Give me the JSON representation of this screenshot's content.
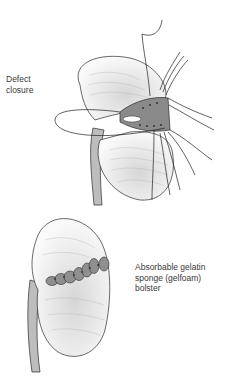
{
  "figure": {
    "panels": [
      {
        "id": "top",
        "label": "Defect\nclosure",
        "description": "Kidney with parenchymal defect being closed with interrupted sutures"
      },
      {
        "id": "bottom",
        "label": "Absorbable gelatin\nsponge (gelfoam)\nbolster",
        "description": "Kidney with sutures tied over a gelfoam bolster"
      }
    ],
    "colors": {
      "line": "#2a2a2a",
      "shade": "#9a9a9a",
      "bolster": "#8c8c8c",
      "background": "#ffffff"
    }
  }
}
